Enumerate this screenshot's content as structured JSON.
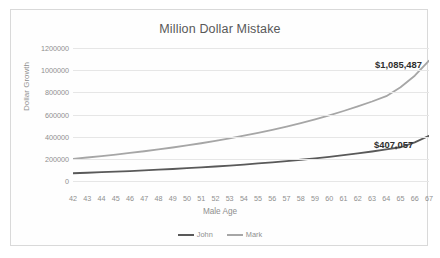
{
  "chart_data": {
    "type": "line",
    "title": "Million Dollar Mistake",
    "xlabel": "Male Age",
    "ylabel": "Dollar Growth",
    "grid": true,
    "legend_position": "bottom",
    "xlim": [
      42,
      67
    ],
    "ylim": [
      0,
      1200000
    ],
    "ytick_labels": [
      "0",
      "200000",
      "400000",
      "600000",
      "800000",
      "1000000",
      "1200000"
    ],
    "ytick_values": [
      0,
      200000,
      400000,
      600000,
      800000,
      1000000,
      1200000
    ],
    "categories": [
      42,
      43,
      44,
      45,
      46,
      47,
      48,
      49,
      50,
      51,
      52,
      53,
      54,
      55,
      56,
      57,
      58,
      59,
      60,
      61,
      62,
      63,
      64,
      65,
      66,
      67
    ],
    "xtick_labels": [
      "42",
      "43",
      "44",
      "45",
      "46",
      "47",
      "48",
      "49",
      "50",
      "51",
      "52",
      "53",
      "54",
      "55",
      "56",
      "57",
      "58",
      "59",
      "60",
      "61",
      "62",
      "63",
      "64",
      "65",
      "66",
      "67"
    ],
    "series": [
      {
        "name": "John",
        "color": "#595959",
        "values": [
          70000,
          74500,
          79300,
          84400,
          89800,
          95600,
          101800,
          108400,
          115400,
          122900,
          130900,
          139400,
          148500,
          158300,
          168700,
          179800,
          191800,
          204600,
          218400,
          233200,
          249100,
          266200,
          284600,
          304400,
          348000,
          407057
        ],
        "end_label": "$407,057"
      },
      {
        "name": "Mark",
        "color": "#a6a6a6",
        "values": [
          200000,
          212000,
          224800,
          238400,
          252900,
          268300,
          284700,
          302200,
          320800,
          340700,
          361900,
          384500,
          408700,
          434500,
          462100,
          491600,
          523100,
          556800,
          592900,
          631500,
          672900,
          717300,
          765000,
          846000,
          950000,
          1085487
        ],
        "end_label": "$1,085,487"
      }
    ],
    "data_labels": [
      {
        "series": "Mark",
        "text": "$1,085,487",
        "value": 1085487
      },
      {
        "series": "John",
        "text": "$407,057",
        "value": 407057
      }
    ],
    "legend": [
      {
        "label": "John",
        "color": "#595959"
      },
      {
        "label": "Mark",
        "color": "#a6a6a6"
      }
    ]
  },
  "colors": {
    "john_line": "#595959",
    "mark_line": "#a6a6a6",
    "gridline": "#e6e6e6",
    "text": "#8f8f8f",
    "title_text": "#585858",
    "border": "#d9d9d9"
  }
}
